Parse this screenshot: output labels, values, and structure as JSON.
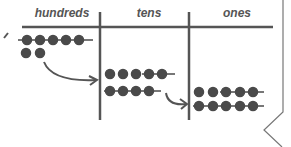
{
  "diagram": {
    "columns": [
      {
        "label": "hundreds"
      },
      {
        "label": "tens"
      },
      {
        "label": "ones"
      }
    ],
    "rows": {
      "hundreds": {
        "row1_dots": 5,
        "row2_dots": 2
      },
      "tens": {
        "row1_dots": 5,
        "row2_dots": 4
      },
      "ones": {
        "row1_dots": 5,
        "row2_dots": 5
      }
    },
    "colors": {
      "ink": "#555555",
      "dot": "#4a4a4a",
      "background": "#ffffff"
    }
  }
}
